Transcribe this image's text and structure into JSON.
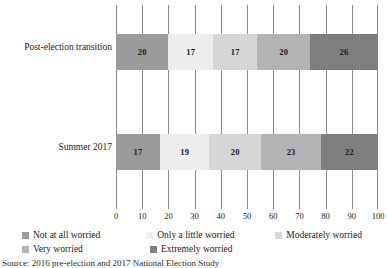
{
  "chart_data": {
    "type": "bar",
    "orientation": "horizontal",
    "stacked": true,
    "normalized_percent": true,
    "title": "",
    "subtitle": "",
    "xlabel": "",
    "ylabel": "",
    "xlim": [
      0,
      100
    ],
    "xticks": [
      0,
      10,
      20,
      30,
      40,
      50,
      60,
      70,
      80,
      90,
      100
    ],
    "xtick_labels": [
      "0",
      "10",
      "20",
      "30",
      "40",
      "50",
      "60",
      "70",
      "80",
      "90",
      "100"
    ],
    "grid": true,
    "grid_axis": "x",
    "legend_position": "bottom-left",
    "categories": [
      "Post-election transition",
      "Summer 2017"
    ],
    "series": [
      {
        "name": "Not at all worried",
        "color": "#9a9a9a",
        "values": [
          20,
          17
        ]
      },
      {
        "name": "Only a little worried",
        "color": "#ededed",
        "values": [
          17,
          19
        ]
      },
      {
        "name": "Moderately worried",
        "color": "#d6d6d6",
        "values": [
          17,
          20
        ]
      },
      {
        "name": "Very worried",
        "color": "#b4b4b4",
        "values": [
          20,
          23
        ]
      },
      {
        "name": "Extremely worried",
        "color": "#7f7f7f",
        "values": [
          26,
          22
        ]
      }
    ]
  },
  "legend": {
    "rows": [
      [
        {
          "label": "Not at all worried",
          "color": "#9a9a9a"
        },
        {
          "label": "Only a little worried",
          "color": "#ededed"
        },
        {
          "label": "Moderately worried",
          "color": "#d6d6d6"
        }
      ],
      [
        {
          "label": "Very worried",
          "color": "#b4b4b4"
        },
        {
          "label": "Extremely worried",
          "color": "#7f7f7f"
        }
      ]
    ]
  },
  "source_note": "Source: 2016 pre-election and 2017 National Election Study"
}
